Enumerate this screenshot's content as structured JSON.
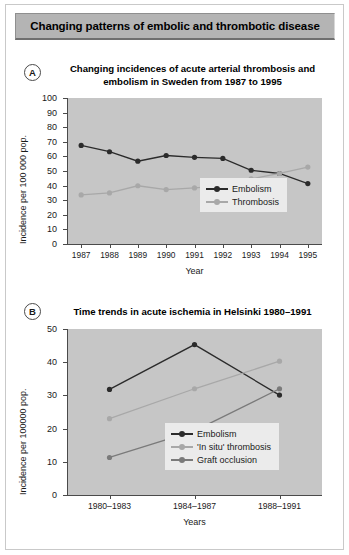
{
  "figure": {
    "title": "Changing patterns of embolic and thrombotic disease",
    "background": "#ffffff",
    "title_bar_color": "#b4b4b4",
    "plot_background": "#c6c6c6"
  },
  "colors": {
    "embolism": "#2b2b2b",
    "thrombosis": "#a8a8a8",
    "in_situ_thrombosis": "#a8a8a8",
    "graft_occlusion": "#7a7a7a",
    "axis": "#4a4a4a",
    "legend_background": "#ebebeb"
  },
  "panels": [
    {
      "badge": "A",
      "title": "Changing incidences of acute arterial thrombosis and embolism in Sweden from 1987 to 1995"
    },
    {
      "badge": "B",
      "title": "Time trends in acute ischemia in Helsinki 1980–1991"
    }
  ],
  "chart_data": [
    {
      "type": "line",
      "panel": "A",
      "title": "Changing incidences of acute arterial thrombosis and embolism in Sweden from 1987 to 1995",
      "xlabel": "Year",
      "ylabel": "Incidence per 100 000 pop.",
      "categories": [
        "1987",
        "1988",
        "1989",
        "1990",
        "1991",
        "1992",
        "1993",
        "1994",
        "1995"
      ],
      "ylim": [
        0,
        100
      ],
      "yticks": [
        0,
        10,
        20,
        30,
        40,
        50,
        60,
        70,
        80,
        90,
        100
      ],
      "grid": false,
      "legend_position": "inside-bottom-right",
      "series": [
        {
          "name": "Embolism",
          "color": "#2b2b2b",
          "values": [
            67.5,
            63.2,
            56.7,
            60.6,
            59.4,
            58.6,
            50.5,
            48.3,
            41.4
          ]
        },
        {
          "name": "Thrombosis",
          "color": "#a8a8a8",
          "values": [
            33.6,
            35.0,
            39.9,
            37.3,
            38.4,
            39.8,
            44.6,
            48.3,
            52.7
          ]
        }
      ]
    },
    {
      "type": "line",
      "panel": "B",
      "title": "Time trends in acute ischemia in Helsinki 1980–1991",
      "xlabel": "Years",
      "ylabel": "Incidence per 100000 pop.",
      "categories": [
        "1980–1983",
        "1984–1987",
        "1988–1991"
      ],
      "ylim": [
        0,
        50
      ],
      "yticks": [
        0,
        10,
        20,
        30,
        40,
        50
      ],
      "grid": false,
      "legend_position": "inside-bottom-right",
      "series": [
        {
          "name": "Embolism",
          "color": "#2b2b2b",
          "values": [
            31.8,
            45.3,
            30.1
          ]
        },
        {
          "name": "'In situ' thrombosis",
          "color": "#a8a8a8",
          "values": [
            23.0,
            32.0,
            40.3
          ]
        },
        {
          "name": "Graft occlusion",
          "color": "#7a7a7a",
          "values": [
            11.3,
            19.3,
            32.0
          ]
        }
      ]
    }
  ]
}
